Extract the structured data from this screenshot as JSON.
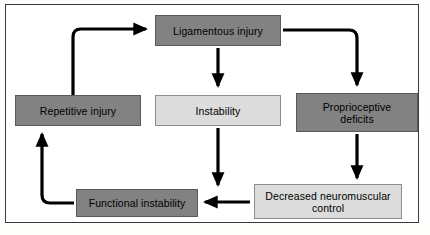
{
  "figure": {
    "border_color": "#3a3a3a",
    "background": "#ffffff"
  },
  "palette": {
    "dark_box": "#828282",
    "light_box": "#dcdcdc",
    "arrow": "#000000",
    "text": "#000000"
  },
  "nodes": [
    {
      "id": "ligamentous-injury",
      "label": "Ligamentous injury",
      "shade": "dark"
    },
    {
      "id": "repetitive-injury",
      "label": "Repetitive injury",
      "shade": "dark"
    },
    {
      "id": "instability",
      "label": "Instability",
      "shade": "light"
    },
    {
      "id": "proprioceptive-deficits",
      "line1": "Proprioceptive",
      "line2": "deficits",
      "shade": "dark"
    },
    {
      "id": "functional-instability",
      "label": "Functional instability",
      "shade": "dark"
    },
    {
      "id": "decreased-neuromuscular-control",
      "line1": "Decreased neuromuscular",
      "line2": "control",
      "shade": "light"
    }
  ],
  "edges": [
    {
      "id": "repetitive-to-ligamentous",
      "from": "repetitive-injury",
      "to": "ligamentous-injury",
      "shape": "up-then-right"
    },
    {
      "id": "ligamentous-to-instability",
      "from": "ligamentous-injury",
      "to": "instability",
      "shape": "down"
    },
    {
      "id": "ligamentous-to-proprioceptive",
      "from": "ligamentous-injury",
      "to": "proprioceptive-deficits",
      "shape": "right-then-down"
    },
    {
      "id": "instability-to-functional",
      "from": "instability",
      "to": "functional-instability",
      "shape": "down"
    },
    {
      "id": "proprioceptive-to-decreased",
      "from": "proprioceptive-deficits",
      "to": "decreased-neuromuscular-control",
      "shape": "down"
    },
    {
      "id": "decreased-to-functional",
      "from": "decreased-neuromuscular-control",
      "to": "functional-instability",
      "shape": "left"
    },
    {
      "id": "functional-to-repetitive",
      "from": "functional-instability",
      "to": "repetitive-injury",
      "shape": "left-then-up"
    }
  ]
}
